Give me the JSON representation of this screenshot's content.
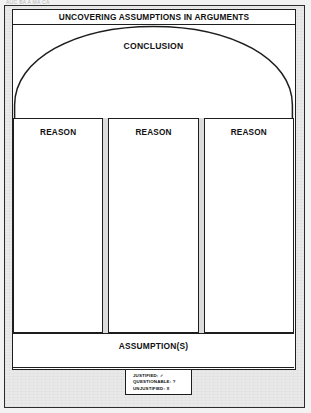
{
  "scan": {
    "top_fragment": "AUC BA  A  MA CA"
  },
  "diagram": {
    "title": "UNCOVERING ASSUMPTIONS IN ARGUMENTS",
    "conclusion": {
      "label": "CONCLUSION"
    },
    "reasons": [
      {
        "label": "REASON"
      },
      {
        "label": "REASON"
      },
      {
        "label": "REASON"
      }
    ],
    "assumption": {
      "label": "ASSUMPTION(S)"
    }
  },
  "legend": {
    "items": [
      {
        "label": "JUSTIFIED:",
        "symbol": "✓",
        "text": "JUSTIFIED: ✓"
      },
      {
        "label": "QUESTIONABLE:",
        "symbol": "?",
        "text": "QUESTIONABLE: ?"
      },
      {
        "label": "UNJUSTIFIED:",
        "symbol": "X",
        "text": "UNJUSTIFIED: X"
      }
    ]
  },
  "colors": {
    "ink": "#1d1d1d",
    "paper": "#ffffff",
    "mat": "#e9e9e9",
    "gap": "#dcdcdc"
  }
}
